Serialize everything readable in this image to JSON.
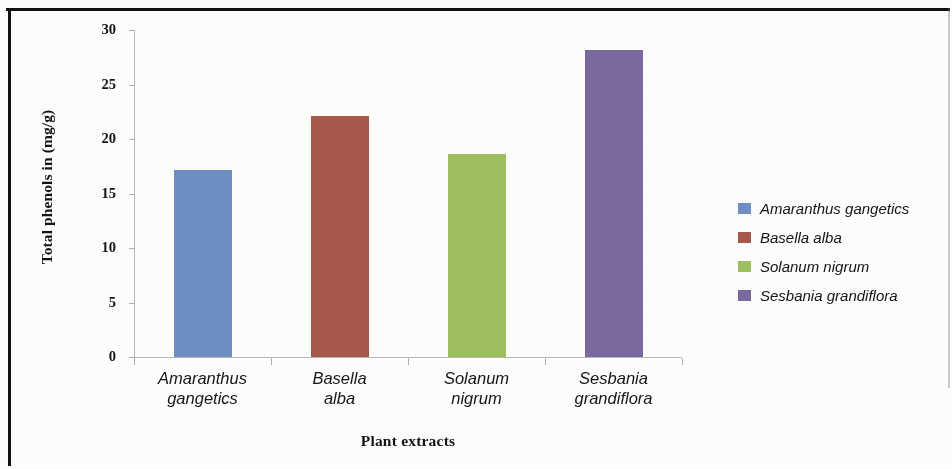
{
  "chart_data": {
    "type": "bar",
    "title": "",
    "categories": [
      "Amaranthus gangetics",
      "Basella alba",
      "Solanum nigrum",
      "Sesbania grandiflora"
    ],
    "category_lines": [
      [
        "Amaranthus",
        "gangetics"
      ],
      [
        "Basella",
        "alba"
      ],
      [
        "Solanum",
        "nigrum"
      ],
      [
        "Sesbania",
        "grandiflora"
      ]
    ],
    "values": [
      17.2,
      22.1,
      18.6,
      28.2
    ],
    "xlabel": "Plant extracts",
    "ylabel": "Total phenols in (mg/g)",
    "ylim": [
      0,
      30
    ],
    "ytick_labels": [
      "0",
      "5",
      "10",
      "15",
      "20",
      "25",
      "30"
    ],
    "ytick_values": [
      0,
      5,
      10,
      15,
      20,
      25,
      30
    ],
    "grid": false,
    "legend_position": "right",
    "colors": [
      "#6d8fc4",
      "#a6594b",
      "#9dbf5d",
      "#79699f"
    ],
    "legend": [
      {
        "label": "Amaranthus gangetics",
        "color": "#6d8fc4"
      },
      {
        "label": "Basella alba",
        "color": "#a6594b"
      },
      {
        "label": "Solanum nigrum",
        "color": "#9dbf5d"
      },
      {
        "label": "Sesbania grandiflora",
        "color": "#79699f"
      }
    ]
  },
  "axes": {
    "y_title": "Total phenols in (mg/g)",
    "x_title": "Plant extracts"
  }
}
